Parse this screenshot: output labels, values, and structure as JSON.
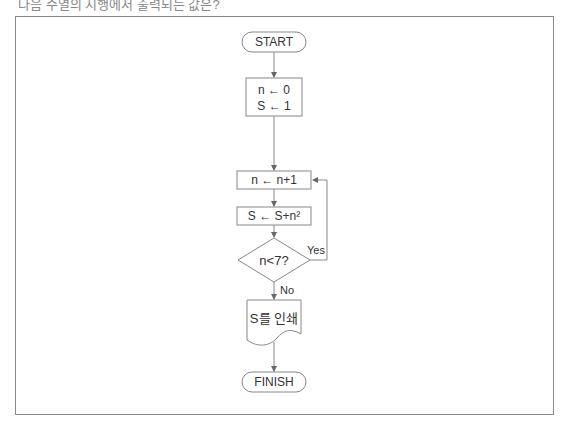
{
  "caption": "다음 수열의 시행에서 출력되는 값은?",
  "flowchart": {
    "start": "START",
    "init": [
      "n ← 0",
      "S ← 1"
    ],
    "increment": "n ← n+1",
    "accumulate": "S ← S+n²",
    "condition": "n<7?",
    "yes_label": "Yes",
    "no_label": "No",
    "output": "S를 인쇄",
    "finish": "FINISH"
  },
  "colors": {
    "line": "#8a8a8a",
    "text": "#333333"
  }
}
